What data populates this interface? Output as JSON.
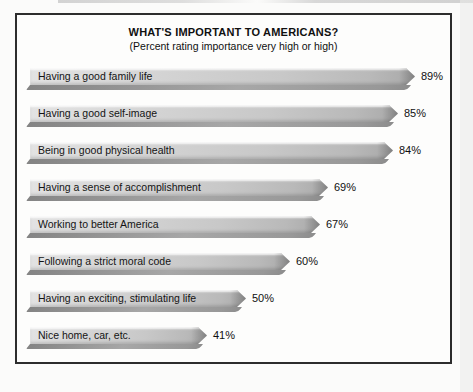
{
  "chart_data": {
    "type": "bar",
    "orientation": "horizontal",
    "title": "WHAT'S IMPORTANT TO AMERICANS?",
    "subtitle": "(Percent rating importance very high or high)",
    "categories": [
      "Having a good family life",
      "Having a good self-image",
      "Being in good physical health",
      "Having a sense of accomplishment",
      "Working to better America",
      "Following a strict moral code",
      "Having an exciting, stimulating life",
      "Nice home, car, etc."
    ],
    "values": [
      89,
      85,
      84,
      69,
      67,
      60,
      50,
      41
    ],
    "value_suffix": "%",
    "xlim": [
      0,
      100
    ],
    "grid": false,
    "legend": "none",
    "bar_face_color": "#c9c9c9",
    "bar_underside_color": "#8f8f8f",
    "frame_border_color": "#2d2d2d",
    "background_color": "#fdfdfc",
    "text_color": "#101010"
  }
}
